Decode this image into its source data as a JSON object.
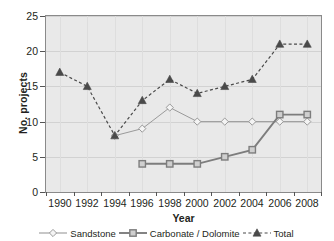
{
  "chart_data": {
    "type": "line",
    "title": "",
    "xlabel": "Year",
    "ylabel": "No. projects",
    "categories": [
      "1990",
      "1992",
      "1994",
      "1996",
      "1998",
      "2000",
      "2002",
      "2004",
      "2006",
      "2008"
    ],
    "ylim": [
      0,
      25
    ],
    "yticks": [
      0,
      5,
      10,
      15,
      20,
      25
    ],
    "grid": true,
    "legend_position": "bottom",
    "series": [
      {
        "name": "Sandstone",
        "marker": "open-diamond",
        "line": "solid",
        "color": "#9a9a9a",
        "values": [
          null,
          null,
          8,
          9,
          12,
          10,
          10,
          10,
          10,
          10
        ]
      },
      {
        "name": "Carbonate / Dolomite",
        "marker": "open-square",
        "line": "solid",
        "color": "#7d7d7d",
        "values": [
          null,
          null,
          null,
          4,
          4,
          4,
          5,
          6,
          11,
          11
        ]
      },
      {
        "name": "Total",
        "marker": "filled-triangle",
        "line": "dashed",
        "color": "#4a4a4a",
        "values": [
          17,
          15,
          8,
          13,
          16,
          14,
          15,
          16,
          21,
          21
        ]
      }
    ]
  },
  "axis": {
    "y_labels": [
      "0",
      "5",
      "10",
      "15",
      "20",
      "25"
    ],
    "x_labels": [
      "1990",
      "1992",
      "1994",
      "1996",
      "1998",
      "2000",
      "2002",
      "2004",
      "2006",
      "2008"
    ],
    "y_title": "No. projects",
    "x_title": "Year"
  },
  "legend": {
    "items": [
      {
        "label": "Sandstone",
        "marker": "open-diamond"
      },
      {
        "label": "Carbonate / Dolomite",
        "marker": "open-square"
      },
      {
        "label": "Total",
        "marker": "filled-triangle"
      }
    ]
  },
  "colors": {
    "plot_background": "#e9e9e9",
    "plot_border": "#8a8a8a",
    "gridline": "#d2d2d2",
    "sandstone": "#9a9a9a",
    "carbonate": "#7d7d7d",
    "total": "#4a4a4a",
    "text": "#231f20"
  }
}
